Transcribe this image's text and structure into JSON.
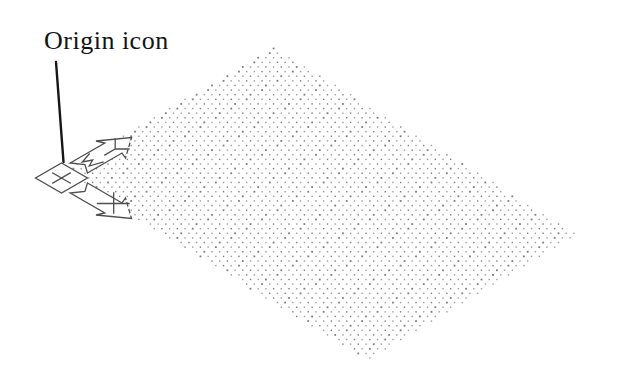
{
  "viewport": {
    "background": "#ffffff"
  },
  "annotation": {
    "label": "Origin icon"
  },
  "ucs_icon": {
    "name": "ucs-origin-icon",
    "stroke": "#4f4f4f",
    "fill": "#ffffff",
    "marks": {
      "origin_cross": "skewed plus at box center",
      "w_mark": "skewed W on Y shaft",
      "y_mark": "skewed Y near upper arrowhead",
      "x_mark": "skewed X near lower arrowhead"
    }
  },
  "grid": {
    "type": "isometric-dot-grid",
    "dot_color_dark": "#7d7d7d",
    "dot_color_light": "#9d9d9d",
    "quad": [
      [
        274,
        49
      ],
      [
        575,
        235
      ],
      [
        367,
        359
      ],
      [
        64,
        172
      ]
    ],
    "row_height": 4.62,
    "col_width": 7.7,
    "stagger": 3.85,
    "dot_size": 1.4,
    "x_min": 58,
    "x_max": 582,
    "y_min": 48.5,
    "y_max": 360.5
  }
}
